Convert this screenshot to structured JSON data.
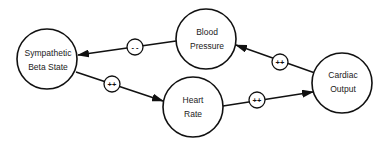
{
  "diagram": {
    "type": "causal-loop",
    "nodes": [
      {
        "id": "sympathetic",
        "label_line1": "Sympathetic",
        "label_line2": "Beta State",
        "cx": 47,
        "cy": 59,
        "r": 30
      },
      {
        "id": "blood_pressure",
        "label_line1": "Blood",
        "label_line2": "Pressure",
        "cx": 206,
        "cy": 39,
        "r": 30
      },
      {
        "id": "heart_rate",
        "label_line1": "Heart",
        "label_line2": "Rate",
        "cx": 193,
        "cy": 107,
        "r": 30
      },
      {
        "id": "cardiac_output",
        "label_line1": "Cardiac",
        "label_line2": "Output",
        "cx": 342,
        "cy": 83,
        "r": 30
      }
    ],
    "edges": [
      {
        "from": "blood_pressure",
        "to": "sympathetic",
        "sign": "- -",
        "sign_cx": 135,
        "sign_cy": 47
      },
      {
        "from": "sympathetic",
        "to": "heart_rate",
        "sign": "++",
        "sign_cx": 112,
        "sign_cy": 84
      },
      {
        "from": "heart_rate",
        "to": "cardiac_output",
        "sign": "++",
        "sign_cx": 257,
        "sign_cy": 100
      },
      {
        "from": "cardiac_output",
        "to": "blood_pressure",
        "sign": "++",
        "sign_cx": 280,
        "sign_cy": 62
      }
    ]
  }
}
